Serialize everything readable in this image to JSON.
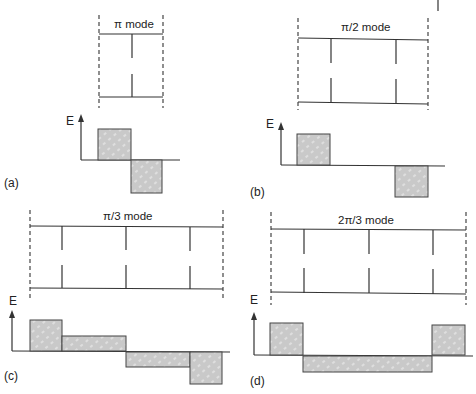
{
  "figure": {
    "panels": [
      {
        "id": "a",
        "label": "(a)",
        "mode_title": "π mode",
        "axis_label": "E",
        "cells": 1,
        "field_pattern": [
          1,
          -1
        ]
      },
      {
        "id": "b",
        "label": "(b)",
        "mode_title": "π/2 mode",
        "axis_label": "E",
        "cells": 2,
        "field_pattern": [
          1,
          0,
          -1
        ]
      },
      {
        "id": "c",
        "label": "(c)",
        "mode_title": "π/3 mode",
        "axis_label": "E",
        "cells": 3,
        "field_pattern": [
          1,
          0.5,
          -0.5,
          -1
        ]
      },
      {
        "id": "d",
        "label": "(d)",
        "mode_title": "2π/3 mode",
        "axis_label": "E",
        "cells": 3,
        "field_pattern": [
          1,
          -0.5,
          -0.5,
          1
        ]
      }
    ],
    "header_fragment": "Structures",
    "colors": {
      "line": "#333333",
      "bar_fill": "#c8c8c8",
      "hatch": "#ffffff"
    }
  }
}
